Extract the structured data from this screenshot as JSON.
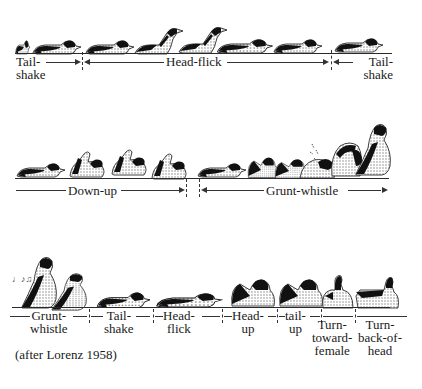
{
  "figure": {
    "credit": "(after Lorenz 1958)",
    "colors": {
      "ink": "#1a1a1a",
      "background": "#ffffff",
      "stipple": "#9a9a9a"
    }
  },
  "rows": [
    {
      "id": "row1",
      "segments": [
        {
          "label_line1": "Tail-",
          "label_line2": "shake"
        },
        {
          "label_line1": "Head-flick",
          "label_line2": ""
        },
        {
          "label_line1": "Tail-",
          "label_line2": "shake"
        }
      ]
    },
    {
      "id": "row2",
      "segments": [
        {
          "label_line1": "Down-up",
          "label_line2": ""
        },
        {
          "label_line1": "Grunt-whistle",
          "label_line2": ""
        }
      ]
    },
    {
      "id": "row3",
      "segments": [
        {
          "label_line1": "Grunt-",
          "label_line2": "whistle",
          "label_line3": ""
        },
        {
          "label_line1": "Tail-",
          "label_line2": "shake",
          "label_line3": ""
        },
        {
          "label_line1": "Head-",
          "label_line2": "flick",
          "label_line3": ""
        },
        {
          "label_line1": "Head-",
          "label_line2": "up",
          "label_line3": ""
        },
        {
          "label_line1": "tail-",
          "label_line2": "up",
          "label_line3": ""
        },
        {
          "label_line1": "Turn-",
          "label_line2": "toward-",
          "label_line3": "female"
        },
        {
          "label_line1": "Turn-",
          "label_line2": "back-of-",
          "label_line3": "head"
        }
      ]
    }
  ],
  "annotations": {
    "whistle_sound_marks": "♩♪♫"
  }
}
